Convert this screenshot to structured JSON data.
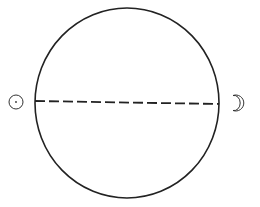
{
  "diagram": {
    "width": 260,
    "height": 207,
    "background": "#ffffff",
    "stroke_color": "#222222",
    "big_circle": {
      "cx": 127,
      "cy": 103,
      "rx": 92,
      "ry": 95,
      "stroke_width": 1.6
    },
    "diameter_line": {
      "x1": 35,
      "y1": 101,
      "x2": 219,
      "y2": 104,
      "dash": "10 4",
      "stroke_width": 1.8
    },
    "sun_symbol": {
      "cx": 16,
      "cy": 102,
      "r": 7,
      "dot_r": 0.9
    },
    "moon_symbol": {
      "cx": 237,
      "cy": 103
    }
  }
}
